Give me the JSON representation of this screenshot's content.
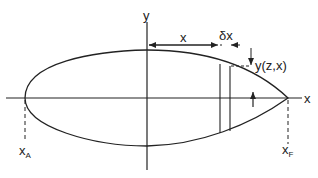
{
  "diagram": {
    "axis_labels": {
      "y": "y",
      "x": "x"
    },
    "dimension_labels": {
      "x": "x",
      "dx": "δx",
      "yzx": "y(z,x)"
    },
    "point_labels": {
      "xA": {
        "base": "x",
        "sub": "A"
      },
      "xF": {
        "base": "x",
        "sub": "F"
      }
    },
    "colors": {
      "stroke": "#222222",
      "background": "#ffffff"
    }
  }
}
